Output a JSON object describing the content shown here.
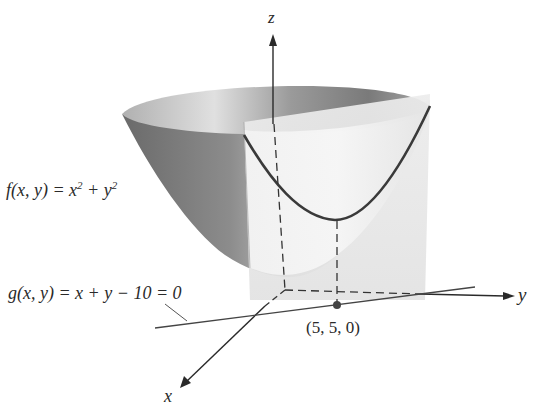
{
  "diagram": {
    "type": "3d-surface-with-constraint-plane",
    "axes": {
      "x_label": "x",
      "y_label": "y",
      "z_label": "z"
    },
    "surface": {
      "label_prefix": "f(x, y) = x",
      "label_exp1": "2",
      "label_mid": " + y",
      "label_exp2": "2",
      "full_label": "f(x, y) = x^2 + y^2",
      "kind": "paraboloid"
    },
    "constraint": {
      "label": "g(x, y) = x + y − 10 = 0",
      "kind": "vertical plane"
    },
    "point": {
      "label": "(5, 5, 0)"
    },
    "colors": {
      "curve": "#3a3a3a",
      "axis": "#2a2a2a",
      "plane": "#e8e8e8",
      "surface_dark": "#6e6e6e",
      "surface_light": "#f2f2f2"
    }
  }
}
